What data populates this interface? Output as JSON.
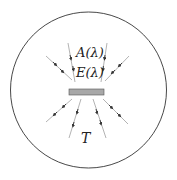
{
  "diagram": {
    "labels": {
      "absorptivity": "A(λ)",
      "emissivity": "E(λ)",
      "temperature": "T"
    },
    "colors": {
      "circle": "#333333",
      "plate_fill": "#a8a8a8",
      "plate_stroke": "#555555",
      "rays": "#9a9a9a",
      "arrowheads": "#333333"
    }
  }
}
